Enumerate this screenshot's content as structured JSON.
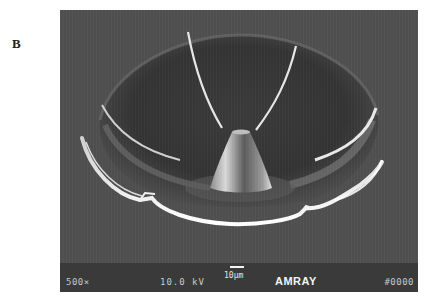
{
  "figure": {
    "panel_label": "B"
  },
  "micrograph": {
    "info_bar": {
      "magnification": "500×",
      "accelerating_voltage": "10.0 kV",
      "scale_bar_label": "10µm",
      "instrument_brand": "AMRAY",
      "image_number": "#0000"
    },
    "colors": {
      "background": "#4e4e4e",
      "bowl_interior": "#363636",
      "highlight": "#f0f0f0",
      "info_bar": "#3a3a3a"
    }
  }
}
